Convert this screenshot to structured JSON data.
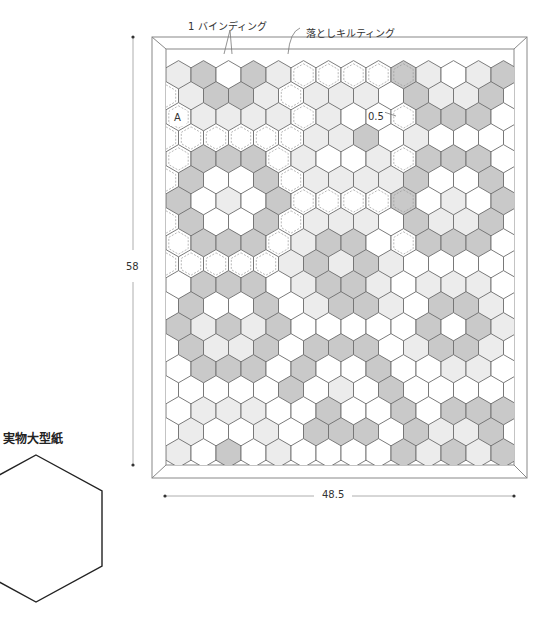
{
  "labels": {
    "binding": "1 バインディング",
    "ditch_quilting": "落としキルティング",
    "block_a": "A",
    "seam": "0.5",
    "height_dim": "58",
    "width_dim": "48.5",
    "template_title": "実物大型紙"
  },
  "colors": {
    "white": "#ffffff",
    "light": "#ececec",
    "dark": "#c9c9c9",
    "line": "#707070",
    "frame": "#888888"
  },
  "grid": {
    "legend": "W=white L=light-gray D=dark-gray; lowercase = quilted (dashed inner line)",
    "rows": [
      "LDWDLwwwwdLWLD",
      "wLDDLwLLLWDLLDW",
      "wLLLLwLWWwDDDW",
      "wwwwwwLLDWLWWWW",
      "wDDDwLWWLwDDDW",
      "wDWWDwLLLLDWWDW",
      "DWLWDwwwwdWLWD",
      "wDWWDwLLLWDLLDW",
      "wDDDwLDDWwDDDW",
      "wwwwwLDLDLWWWWW",
      "WDDDWLDDLWLLLW",
      "WDWWDWLDDLWDDLW",
      "DLDLDWWWWWDWDL",
      "WDLLDWDDDWLDDLW",
      "WDDDWDWWDWWLLW",
      "WWWWWDWLWDWWWWW",
      "WLLLWWDWWDWDDDW",
      "WLWWLWDDDWDLLDW",
      "LWDWLWWWWDLDLD"
    ]
  }
}
